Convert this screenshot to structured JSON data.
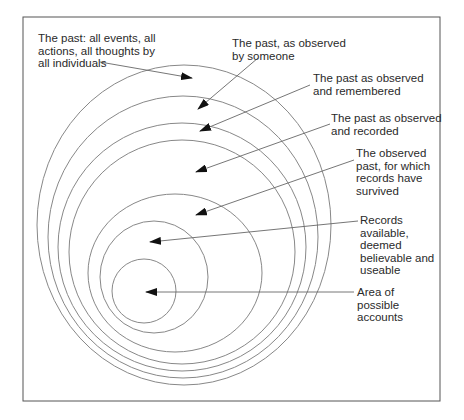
{
  "diagram": {
    "frame": {
      "x": 23,
      "y": 17,
      "w": 417,
      "h": 384,
      "stroke": "#555555"
    },
    "circle_stroke": "#888888",
    "arrow_color": "#111111",
    "circles": [
      {
        "cx": 184,
        "cy": 225,
        "rx": 147,
        "ry": 160
      },
      {
        "cx": 183,
        "cy": 237,
        "rx": 135,
        "ry": 141
      },
      {
        "cx": 182,
        "cy": 247,
        "rx": 124,
        "ry": 124
      },
      {
        "cx": 182,
        "cy": 252,
        "rx": 113,
        "ry": 112
      },
      {
        "cx": 175,
        "cy": 273,
        "rx": 87,
        "ry": 79
      },
      {
        "cx": 154,
        "cy": 277,
        "rx": 54,
        "ry": 56
      },
      {
        "cx": 144,
        "cy": 291,
        "rx": 32,
        "ry": 32
      }
    ],
    "labels": [
      {
        "id": "all-past",
        "text": "The past: all events, all\nactions, all thoughts by\nall individuals",
        "x": 38,
        "y": 32,
        "line": {
          "x1": 100,
          "y1": 62,
          "x2": 192,
          "y2": 78
        }
      },
      {
        "id": "observed",
        "text": "The past, as observed\nby someone",
        "x": 232,
        "y": 37,
        "line": {
          "x1": 258,
          "y1": 58,
          "x2": 198,
          "y2": 109
        }
      },
      {
        "id": "remembered",
        "text": "The past as observed\nand remembered",
        "x": 313,
        "y": 72,
        "line": {
          "x1": 310,
          "y1": 85,
          "x2": 200,
          "y2": 131
        }
      },
      {
        "id": "recorded",
        "text": "The past as observed\nand recorded",
        "x": 331,
        "y": 112,
        "line": {
          "x1": 330,
          "y1": 124,
          "x2": 196,
          "y2": 172
        }
      },
      {
        "id": "survived",
        "text": "The observed\npast, for which\nrecords have\nsurvived",
        "x": 356,
        "y": 147,
        "line": {
          "x1": 354,
          "y1": 160,
          "x2": 196,
          "y2": 215
        }
      },
      {
        "id": "usable",
        "text": "Records\navailable,\ndeemed\nbelievable and\nuseable",
        "x": 360,
        "y": 214,
        "line": {
          "x1": 358,
          "y1": 221,
          "x2": 150,
          "y2": 242
        }
      },
      {
        "id": "accounts",
        "text": "Area of\npossible\naccounts",
        "x": 357,
        "y": 286,
        "line": {
          "x1": 354,
          "y1": 292,
          "x2": 146,
          "y2": 292
        }
      }
    ]
  }
}
